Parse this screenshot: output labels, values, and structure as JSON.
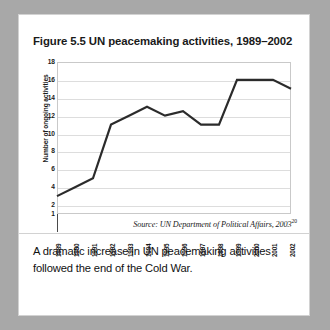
{
  "figure": {
    "title": "Figure 5.5 UN peacemaking activities, 1989–2002",
    "source_prefix": "Source: UN Department of Political Affairs, 2003",
    "source_superscript": "20",
    "caption": "A dramatic increase in UN peacemaking activities followed the end of the Cold War."
  },
  "chart_data": {
    "type": "line",
    "title": "Figure 5.5 UN peacemaking activities, 1989–2002",
    "xlabel": "",
    "ylabel": "Number of ongoing activities",
    "categories": [
      "1989",
      "1990",
      "1991",
      "1992",
      "1993",
      "1994",
      "1995",
      "1996",
      "1997",
      "1998",
      "1999",
      "2000",
      "2001",
      "2002"
    ],
    "values": [
      3,
      4,
      5,
      11,
      12,
      13,
      12,
      12.5,
      11,
      11,
      16,
      16,
      16,
      15
    ],
    "ylim": [
      1,
      18
    ],
    "yticks": [
      18,
      16,
      14,
      12,
      10,
      8,
      6,
      4,
      2,
      1
    ],
    "grid": true,
    "legend": "none",
    "line_color": "#2b2b2b",
    "grid_color": "#dddddd",
    "frame_color": "#c9c9c9"
  },
  "colors": {
    "page_background": "#a8a8a8",
    "card_background": "#ffffff",
    "text": "#1a1a1a",
    "accent": "#2b2b2b"
  }
}
